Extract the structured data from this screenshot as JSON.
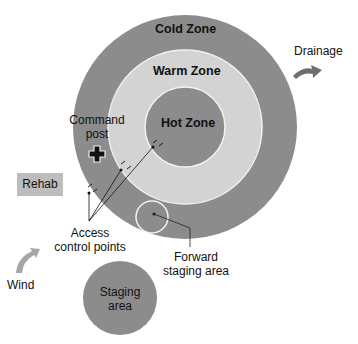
{
  "diagram": {
    "zones": {
      "cold": {
        "label": "Cold Zone",
        "color": "#8c8c8c"
      },
      "warm": {
        "label": "Warm Zone",
        "color": "#d3d3d3"
      },
      "hot": {
        "label": "Hot Zone",
        "color": "#8c8c8c"
      }
    },
    "command_post": {
      "line1": "Command",
      "line2": "post"
    },
    "rehab": {
      "label": "Rehab",
      "color": "#bdbdbd"
    },
    "access_control": {
      "line1": "Access",
      "line2": "control points"
    },
    "forward_staging": {
      "line1": "Forward",
      "line2": "staging area"
    },
    "staging_area": {
      "line1": "Staging",
      "line2": "area",
      "color": "#8c8c8c"
    },
    "wind": {
      "label": "Wind",
      "arrow_color": "#a6a6a6"
    },
    "drainage": {
      "label": "Drainage",
      "arrow_color": "#6e6e6e"
    }
  }
}
